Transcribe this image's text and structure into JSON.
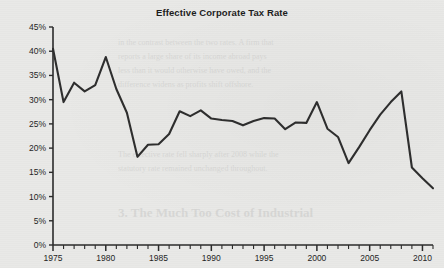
{
  "chart_data": {
    "type": "line",
    "title": "Effective Corporate Tax Rate",
    "xlabel": "",
    "ylabel": "",
    "xlim": [
      1975,
      2011
    ],
    "ylim": [
      0,
      45
    ],
    "grid": false,
    "legend": null,
    "y_tick_labels": [
      "45%",
      "40%",
      "35%",
      "30%",
      "25%",
      "20%",
      "15%",
      "10%",
      "5%",
      "0%"
    ],
    "y_tick_values": [
      45,
      40,
      35,
      30,
      25,
      20,
      15,
      10,
      5,
      0
    ],
    "x_tick_labels": [
      "1975",
      "1980",
      "1985",
      "1990",
      "1995",
      "2000",
      "2005",
      "2010"
    ],
    "x_tick_values": [
      1975,
      1980,
      1985,
      1990,
      1995,
      2000,
      2005,
      2010
    ],
    "x_minor_tick_step": 1,
    "series": [
      {
        "name": "Effective Corporate Tax Rate",
        "color": "#2e2e2e",
        "x": [
          1975,
          1976,
          1977,
          1978,
          1979,
          1980,
          1981,
          1982,
          1983,
          1984,
          1985,
          1986,
          1987,
          1988,
          1989,
          1990,
          1991,
          1992,
          1993,
          1994,
          1995,
          1996,
          1997,
          1998,
          1999,
          2000,
          2001,
          2002,
          2003,
          2004,
          2005,
          2006,
          2007,
          2008,
          2009,
          2010,
          2011
        ],
        "values": [
          40.5,
          29.5,
          33.5,
          31.7,
          33.0,
          38.8,
          32.2,
          27.3,
          18.2,
          20.7,
          20.8,
          22.9,
          27.6,
          26.6,
          27.8,
          26.1,
          25.8,
          25.6,
          24.7,
          25.6,
          26.2,
          26.1,
          23.9,
          25.3,
          25.2,
          29.5,
          24.0,
          22.3,
          16.9,
          20.2,
          23.7,
          26.9,
          29.5,
          31.7,
          16.0,
          13.8,
          11.7
        ]
      }
    ]
  },
  "background_bleed_text": [
    "in the contrast between the two rates. A firm that",
    "reports a large share of its income abroad pays",
    "less than it would otherwise have owed, and the",
    "difference widens as profits shift offshore.",
    "The effective rate fell sharply after 2008 while the",
    "statutory rate remained unchanged throughout.",
    "3. The Much Too Cost of Industrial"
  ]
}
